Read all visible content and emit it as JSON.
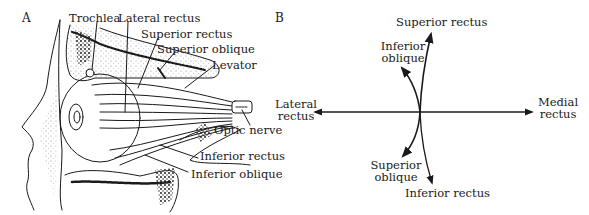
{
  "panel_a": {
    "letter": "A",
    "labels": {
      "trochlea": "Trochlea",
      "lateral_rectus": "Lateral rectus",
      "superior_rectus": "Superior rectus",
      "superior_oblique": "Superior oblique",
      "levator": "Levator",
      "optic_nerve": "Optic nerve",
      "inferior_rectus": "Inferior rectus",
      "inferior_oblique": "Inferior oblique"
    }
  },
  "panel_b": {
    "letter": "B",
    "labels": {
      "superior_rectus": "Superior rectus",
      "inferior_oblique_1": "Inferior",
      "inferior_oblique_2": "oblique",
      "lateral_rectus_1": "Lateral",
      "lateral_rectus_2": "rectus",
      "medial_rectus_1": "Medial",
      "medial_rectus_2": "rectus",
      "superior_oblique_1": "Superior",
      "superior_oblique_2": "oblique",
      "inferior_rectus": "Inferior rectus"
    }
  },
  "colors": {
    "ink": "#1a1a1a",
    "background": "#ffffff"
  }
}
